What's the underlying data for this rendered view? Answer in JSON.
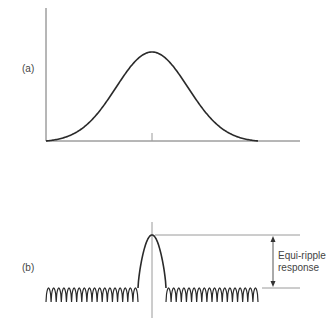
{
  "panels": {
    "a": {
      "label": "(a)",
      "description": "Smooth bell-shaped (Gaussian-like) response with no sidelobes"
    },
    "b": {
      "label": "(b)",
      "description": "Narrow main lobe with equal-amplitude sidelobe ripples",
      "annotation_line1": "Equi-ripple",
      "annotation_line2": "response",
      "ripples_left": 18,
      "ripples_right": 18
    }
  },
  "colors": {
    "curve": "#2a2a2a",
    "axis": "#6e6e6e",
    "guide": "#9a9a9a",
    "text": "#444444"
  }
}
